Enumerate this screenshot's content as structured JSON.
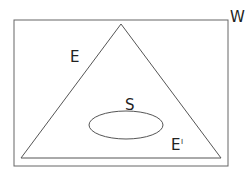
{
  "diagram": {
    "universe_label": "W",
    "triangle_label": "E",
    "ellipse_label": "S",
    "complement_label": "E",
    "complement_mark": "I",
    "stroke_color": "#555555"
  }
}
